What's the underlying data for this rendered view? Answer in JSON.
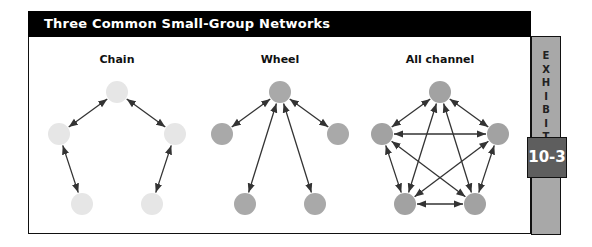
{
  "header": {
    "title": "Three Common Small-Group Networks"
  },
  "exhibit": {
    "side_label": "EXHIBIT",
    "number": "10-3"
  },
  "colors": {
    "chain_node": "#e6e6e6",
    "wheel_node": "#a9a9a9",
    "all_channel_node": "#a2a2a2",
    "side_panel": "#a8a8a8",
    "badge": "#5e5e5e",
    "arrow": "#333333"
  },
  "networks": [
    {
      "name": "Chain",
      "nodes": 5,
      "connections": "sequential"
    },
    {
      "name": "Wheel",
      "nodes": 5,
      "connections": "hub-to-each"
    },
    {
      "name": "All channel",
      "nodes": 5,
      "connections": "all-to-all"
    }
  ]
}
